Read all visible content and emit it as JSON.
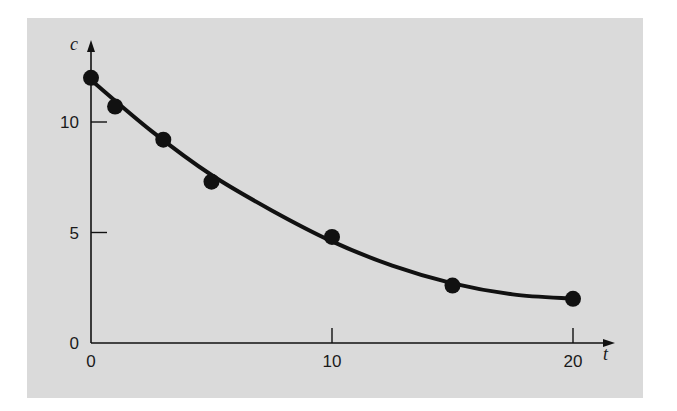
{
  "chart_data": {
    "type": "scatter",
    "title": "",
    "xlabel": "t",
    "ylabel": "c",
    "xlim": [
      0,
      20
    ],
    "ylim": [
      0,
      12
    ],
    "grid": false,
    "legend": null,
    "x_ticks": [
      "0",
      "10",
      "20"
    ],
    "y_ticks": [
      "0",
      "5",
      "10"
    ],
    "series": [
      {
        "name": "data",
        "kind": "points",
        "x": [
          0,
          1,
          3,
          5,
          10,
          15,
          20
        ],
        "y": [
          12,
          10.7,
          9.2,
          7.3,
          4.8,
          2.6,
          2.0
        ]
      },
      {
        "name": "fit",
        "kind": "smooth-curve",
        "x": [
          0,
          2.5,
          5,
          7.5,
          10,
          12.5,
          15,
          17.5,
          20
        ],
        "y": [
          11.9,
          9.6,
          7.6,
          6.0,
          4.6,
          3.5,
          2.7,
          2.2,
          2.0
        ]
      }
    ]
  },
  "colors": {
    "panel": "#dadada",
    "ink": "#111111"
  }
}
